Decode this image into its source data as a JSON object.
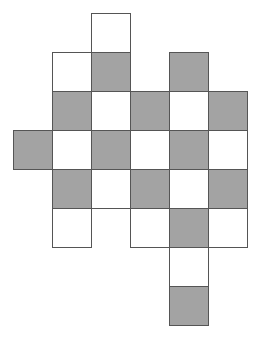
{
  "diagram": {
    "colors": {
      "shaded": "#a3a3a3",
      "unshaded": "#ffffff",
      "border": "#555555"
    },
    "cell_size": 39,
    "origin": {
      "x": 13,
      "y": 13
    },
    "cells": [
      {
        "row": 0,
        "col": 2,
        "shade": "white"
      },
      {
        "row": 1,
        "col": 1,
        "shade": "white"
      },
      {
        "row": 1,
        "col": 2,
        "shade": "gray"
      },
      {
        "row": 1,
        "col": 4,
        "shade": "gray"
      },
      {
        "row": 2,
        "col": 1,
        "shade": "gray"
      },
      {
        "row": 2,
        "col": 2,
        "shade": "white"
      },
      {
        "row": 2,
        "col": 3,
        "shade": "gray"
      },
      {
        "row": 2,
        "col": 4,
        "shade": "white"
      },
      {
        "row": 2,
        "col": 5,
        "shade": "gray"
      },
      {
        "row": 3,
        "col": 0,
        "shade": "gray"
      },
      {
        "row": 3,
        "col": 1,
        "shade": "white"
      },
      {
        "row": 3,
        "col": 2,
        "shade": "gray"
      },
      {
        "row": 3,
        "col": 3,
        "shade": "white"
      },
      {
        "row": 3,
        "col": 4,
        "shade": "gray"
      },
      {
        "row": 3,
        "col": 5,
        "shade": "white"
      },
      {
        "row": 4,
        "col": 1,
        "shade": "gray"
      },
      {
        "row": 4,
        "col": 2,
        "shade": "white"
      },
      {
        "row": 4,
        "col": 3,
        "shade": "gray"
      },
      {
        "row": 4,
        "col": 4,
        "shade": "white"
      },
      {
        "row": 4,
        "col": 5,
        "shade": "gray"
      },
      {
        "row": 5,
        "col": 1,
        "shade": "white"
      },
      {
        "row": 5,
        "col": 3,
        "shade": "white"
      },
      {
        "row": 5,
        "col": 4,
        "shade": "gray"
      },
      {
        "row": 5,
        "col": 5,
        "shade": "white"
      },
      {
        "row": 6,
        "col": 4,
        "shade": "white"
      },
      {
        "row": 7,
        "col": 4,
        "shade": "gray"
      }
    ]
  }
}
